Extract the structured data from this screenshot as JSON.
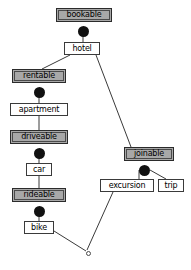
{
  "diagram": {
    "colors": {
      "abstract_fill": "#a8a8a8",
      "concrete_fill": "#ffffff",
      "stroke": "#3a3a3a",
      "connector": "#111111",
      "background": "#ffffff"
    },
    "nodes": [
      {
        "id": "bookable",
        "label": "bookable",
        "kind": "abstract",
        "x": 56,
        "y": 8,
        "w": 56
      },
      {
        "id": "hotel",
        "label": "hotel",
        "kind": "concrete",
        "x": 64,
        "y": 42,
        "w": 36
      },
      {
        "id": "rentable",
        "label": "rentable",
        "kind": "abstract",
        "x": 12,
        "y": 69,
        "w": 54
      },
      {
        "id": "apartment",
        "label": "apartment",
        "kind": "concrete",
        "x": 10,
        "y": 103,
        "w": 58
      },
      {
        "id": "driveable",
        "label": "driveable",
        "kind": "abstract",
        "x": 10,
        "y": 130,
        "w": 58
      },
      {
        "id": "car",
        "label": "car",
        "kind": "concrete",
        "x": 26,
        "y": 163,
        "w": 26
      },
      {
        "id": "rideable",
        "label": "rideable",
        "kind": "abstract",
        "x": 12,
        "y": 188,
        "w": 54
      },
      {
        "id": "bike",
        "label": "bike",
        "kind": "concrete",
        "x": 24,
        "y": 221,
        "w": 30
      },
      {
        "id": "joinable",
        "label": "joinable",
        "kind": "abstract",
        "x": 124,
        "y": 147,
        "w": 50
      },
      {
        "id": "excursion",
        "label": "excursion",
        "kind": "concrete",
        "x": 100,
        "y": 179,
        "w": 54
      },
      {
        "id": "trip",
        "label": "trip",
        "kind": "concrete",
        "x": 158,
        "y": 179,
        "w": 26
      }
    ],
    "discs": [
      {
        "id": "disc-bookable",
        "for": "bookable",
        "x": 78,
        "y": 26
      },
      {
        "id": "disc-rentable",
        "for": "rentable",
        "x": 34,
        "y": 87
      },
      {
        "id": "disc-driveable",
        "for": "driveable",
        "x": 34,
        "y": 148
      },
      {
        "id": "disc-rideable",
        "for": "rideable",
        "x": 34,
        "y": 206
      },
      {
        "id": "disc-joinable",
        "for": "joinable",
        "x": 139,
        "y": 165
      }
    ],
    "vertices": [
      {
        "id": "join-vertex",
        "x": 86,
        "y": 251
      }
    ],
    "edges": [
      {
        "id": "bookable-hotel",
        "from": "bookable",
        "to": "hotel",
        "x1": 83,
        "y1": 30,
        "x2": 83,
        "y2": 42
      },
      {
        "id": "hotel-rentable",
        "from": "hotel",
        "to": "rentable",
        "x1": 70,
        "y1": 55,
        "x2": 42,
        "y2": 69
      },
      {
        "id": "hotel-joinable",
        "from": "hotel",
        "to": "joinable",
        "x1": 96,
        "y1": 55,
        "x2": 131,
        "y2": 147
      },
      {
        "id": "rentable-apartment",
        "from": "rentable",
        "to": "apartment",
        "x1": 39,
        "y1": 91,
        "x2": 39,
        "y2": 103
      },
      {
        "id": "apartment-driveable",
        "from": "apartment",
        "to": "driveable",
        "x1": 39,
        "y1": 116,
        "x2": 39,
        "y2": 130
      },
      {
        "id": "driveable-car",
        "from": "driveable",
        "to": "car",
        "x1": 39,
        "y1": 152,
        "x2": 39,
        "y2": 163
      },
      {
        "id": "car-rideable",
        "from": "car",
        "to": "rideable",
        "x1": 39,
        "y1": 176,
        "x2": 39,
        "y2": 188
      },
      {
        "id": "rideable-bike",
        "from": "rideable",
        "to": "bike",
        "x1": 39,
        "y1": 210,
        "x2": 39,
        "y2": 221
      },
      {
        "id": "bike-vertex",
        "from": "bike",
        "to": "join-vertex",
        "x1": 54,
        "y1": 231,
        "x2": 86,
        "y2": 251
      },
      {
        "id": "joinable-excursion",
        "from": "joinable",
        "to": "excursion",
        "x1": 139,
        "y1": 170,
        "x2": 139,
        "y2": 179
      },
      {
        "id": "joinable-trip",
        "from": "joinable",
        "to": "trip",
        "x1": 150,
        "y1": 170,
        "x2": 166,
        "y2": 179
      },
      {
        "id": "excursion-vertex",
        "from": "excursion",
        "to": "join-vertex",
        "x1": 113,
        "y1": 192,
        "x2": 87,
        "y2": 250
      }
    ]
  }
}
